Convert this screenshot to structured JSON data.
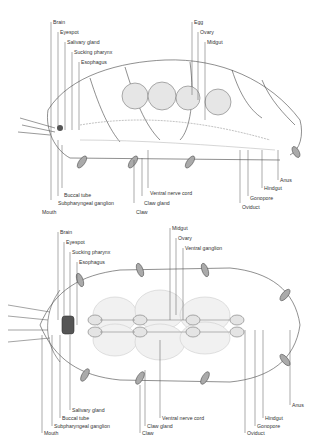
{
  "figure": {
    "panels": [
      {
        "id": "lateral",
        "view": "lateral view",
        "labels_top_left": [
          "Brain",
          "Eyespot",
          "Salivary gland",
          "Sucking pharynx",
          "Esophagus"
        ],
        "labels_top_right": [
          "Egg",
          "Ovary",
          "Midgut"
        ],
        "labels_bottom_left": [
          "Buccal tube",
          "Subpharyngeal ganglion",
          "Mouth"
        ],
        "labels_bottom_middle": [
          "Ventral nerve cord",
          "Claw gland",
          "Claw"
        ],
        "labels_bottom_right": [
          "Anus",
          "Hindgut",
          "Gonopore",
          "Oviduct"
        ]
      },
      {
        "id": "dorsal",
        "view": "dorsal view",
        "labels_top_left": [
          "Brain",
          "Eyespot",
          "Sucking pharynx",
          "Esophagus"
        ],
        "labels_top_right": [
          "Midgut",
          "Ovary",
          "Ventral ganglion"
        ],
        "labels_bottom_left": [
          "Salivary gland",
          "Buccal tube",
          "Subpharyngeal ganglion",
          "Mouth"
        ],
        "labels_bottom_middle": [
          "Ventral nerve cord",
          "Claw gland",
          "Claw"
        ],
        "labels_bottom_right": [
          "Anus",
          "Hindgut",
          "Gonopore",
          "Oviduct"
        ]
      }
    ]
  },
  "colors": {
    "ink": "#333333",
    "shade": "#bdbdbd",
    "background": "#ffffff"
  }
}
